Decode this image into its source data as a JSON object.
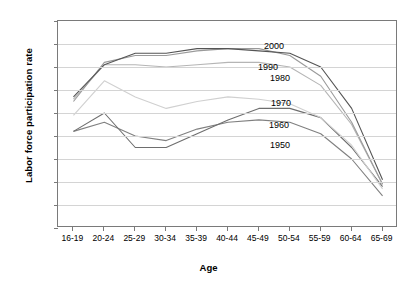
{
  "chart_data": {
    "type": "line",
    "title": "",
    "xlabel": "Age",
    "ylabel": "Labor force participation rate",
    "categories": [
      "16-19",
      "20-24",
      "25-29",
      "30-34",
      "35-39",
      "40-44",
      "45-49",
      "50-54",
      "55-59",
      "60-64",
      "65-69"
    ],
    "ylim": [
      0,
      90
    ],
    "ytick_labels": [
      "0%",
      "10%",
      "20%",
      "30%",
      "40%",
      "50%",
      "60%",
      "70%",
      "80%",
      "90%"
    ],
    "ytick_values": [
      0,
      10,
      20,
      30,
      40,
      50,
      60,
      70,
      80,
      90
    ],
    "grid": "horizontal",
    "legend": "inline-right-labels",
    "series": [
      {
        "name": "1950",
        "color": "#808080",
        "values": [
          42,
          46,
          40,
          38,
          43,
          46,
          47,
          46,
          41,
          30,
          14
        ]
      },
      {
        "name": "1960",
        "color": "#6e6e6e",
        "values": [
          42,
          50,
          35,
          35,
          41,
          47,
          52,
          52,
          48,
          35,
          18
        ]
      },
      {
        "name": "1970",
        "color": "#d0d0d0",
        "values": [
          49,
          64,
          57,
          52,
          55,
          57,
          56,
          54,
          48,
          36,
          17
        ]
      },
      {
        "name": "1980",
        "color": "#b5b5b5",
        "values": [
          56,
          71,
          71,
          70,
          71,
          72,
          72,
          70,
          62,
          45,
          19
        ]
      },
      {
        "name": "1990",
        "color": "#9a9a9a",
        "values": [
          55,
          72,
          75,
          75,
          77,
          78,
          78,
          75,
          66,
          46,
          19
        ]
      },
      {
        "name": "2000",
        "color": "#555555",
        "values": [
          57,
          71,
          76,
          76,
          78,
          78,
          77,
          76,
          70,
          52,
          21
        ]
      }
    ]
  },
  "axis": {
    "x_title": "Age",
    "y_title": "Labor force participation rate"
  }
}
